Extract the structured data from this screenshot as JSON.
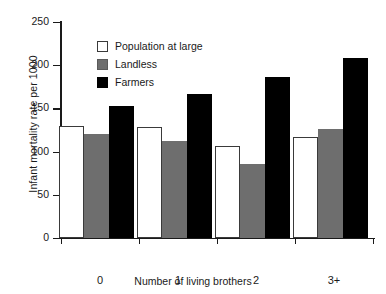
{
  "chart_data": {
    "type": "bar",
    "title": "",
    "xlabel": "Number of living brothers",
    "ylabel": "Infant mortality rate per 1000",
    "categories": [
      "0",
      "1",
      "2",
      "3+"
    ],
    "series": [
      {
        "name": "Population at large",
        "color": "#ffffff",
        "values": [
          130,
          128,
          107,
          117
        ]
      },
      {
        "name": "Landless",
        "color": "#6e6e6e",
        "values": [
          120,
          112,
          86,
          126
        ]
      },
      {
        "name": "Farmers",
        "color": "#000000",
        "values": [
          153,
          167,
          186,
          208
        ]
      }
    ],
    "ylim": [
      0,
      250
    ],
    "yticks": [
      0,
      50,
      100,
      150,
      200,
      250
    ],
    "ytick_labels": [
      "0",
      "50",
      "100",
      "150",
      "200",
      "250"
    ],
    "grid": false,
    "legend_position": "upper-left-inside"
  }
}
